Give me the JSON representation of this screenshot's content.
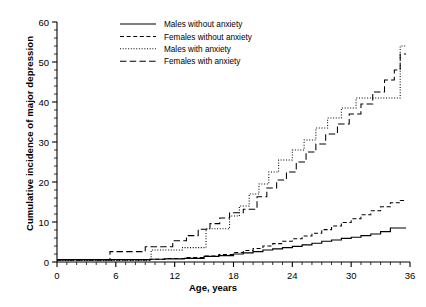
{
  "chart_data": {
    "type": "line",
    "title": "",
    "xlabel": "Age, years",
    "ylabel": "Cumulative incidence of major depression",
    "xlim": [
      0,
      36
    ],
    "ylim": [
      0,
      60
    ],
    "xticks": [
      0,
      6,
      12,
      18,
      24,
      30,
      36
    ],
    "yticks": [
      0,
      10,
      20,
      30,
      40,
      50,
      60
    ],
    "xtick_labels": [
      "0",
      "6",
      "12",
      "18",
      "24",
      "30",
      "36"
    ],
    "ytick_labels": [
      "0",
      "10",
      "20",
      "30",
      "40",
      "50",
      "60"
    ],
    "minor_ticks": true,
    "grid": false,
    "legend_position": "top-center",
    "step_style": "post",
    "series": [
      {
        "name": "Males without anxiety",
        "dash": "solid",
        "color": "#000000",
        "points": [
          [
            0,
            0.6
          ],
          [
            5.0,
            0.6
          ],
          [
            9.5,
            0.7
          ],
          [
            11.0,
            0.8
          ],
          [
            13.0,
            0.9
          ],
          [
            15.0,
            1.4
          ],
          [
            16.5,
            1.6
          ],
          [
            18.0,
            2.0
          ],
          [
            19.0,
            2.3
          ],
          [
            20.0,
            2.6
          ],
          [
            21.0,
            3.0
          ],
          [
            22.0,
            3.3
          ],
          [
            23.0,
            3.6
          ],
          [
            24.0,
            3.9
          ],
          [
            25.0,
            4.3
          ],
          [
            26.0,
            4.7
          ],
          [
            27.0,
            5.2
          ],
          [
            28.0,
            5.5
          ],
          [
            29.0,
            5.9
          ],
          [
            30.0,
            6.2
          ],
          [
            31.0,
            6.6
          ],
          [
            32.0,
            7.0
          ],
          [
            33.0,
            7.6
          ],
          [
            34.0,
            8.5
          ],
          [
            35.6,
            8.5
          ]
        ]
      },
      {
        "name": "Females without anxiety",
        "dash": "dash-short",
        "color": "#000000",
        "points": [
          [
            0,
            0.5
          ],
          [
            5.0,
            0.5
          ],
          [
            9.5,
            0.7
          ],
          [
            11.0,
            0.9
          ],
          [
            13.0,
            1.1
          ],
          [
            15.0,
            1.5
          ],
          [
            16.5,
            1.9
          ],
          [
            18.0,
            2.4
          ],
          [
            19.0,
            2.9
          ],
          [
            20.0,
            3.4
          ],
          [
            21.0,
            4.0
          ],
          [
            22.0,
            4.6
          ],
          [
            23.0,
            5.2
          ],
          [
            24.0,
            5.8
          ],
          [
            25.0,
            6.5
          ],
          [
            26.0,
            7.2
          ],
          [
            27.0,
            8.1
          ],
          [
            28.0,
            9.0
          ],
          [
            29.0,
            9.9
          ],
          [
            30.0,
            10.8
          ],
          [
            31.0,
            11.8
          ],
          [
            32.0,
            12.8
          ],
          [
            33.0,
            13.8
          ],
          [
            34.0,
            14.8
          ],
          [
            35.0,
            15.4
          ],
          [
            35.6,
            15.5
          ]
        ]
      },
      {
        "name": "Males with anxiety",
        "dash": "dotted",
        "color": "#000000",
        "points": [
          [
            0,
            0.4
          ],
          [
            9.6,
            0.4
          ],
          [
            9.6,
            3.0
          ],
          [
            12.8,
            3.0
          ],
          [
            12.8,
            3.6
          ],
          [
            15.2,
            3.6
          ],
          [
            15.2,
            8.3
          ],
          [
            17.6,
            8.3
          ],
          [
            17.6,
            11.5
          ],
          [
            18.6,
            11.5
          ],
          [
            18.6,
            14.0
          ],
          [
            19.6,
            14.0
          ],
          [
            19.6,
            17.0
          ],
          [
            20.6,
            17.0
          ],
          [
            20.6,
            19.5
          ],
          [
            21.6,
            19.5
          ],
          [
            21.6,
            22.5
          ],
          [
            22.6,
            22.5
          ],
          [
            22.6,
            25.5
          ],
          [
            24.0,
            25.5
          ],
          [
            24.0,
            28.0
          ],
          [
            25.2,
            28.0
          ],
          [
            25.2,
            30.5
          ],
          [
            26.4,
            30.5
          ],
          [
            26.4,
            33.5
          ],
          [
            27.6,
            33.5
          ],
          [
            27.6,
            36.0
          ],
          [
            29.0,
            36.0
          ],
          [
            29.0,
            38.5
          ],
          [
            30.5,
            38.5
          ],
          [
            30.5,
            41.0
          ],
          [
            35.0,
            41.0
          ],
          [
            35.0,
            54.0
          ],
          [
            35.6,
            54.0
          ]
        ]
      },
      {
        "name": "Females with anxiety",
        "dash": "dash-long",
        "color": "#000000",
        "points": [
          [
            0,
            0.5
          ],
          [
            5.4,
            0.5
          ],
          [
            5.4,
            2.6
          ],
          [
            9.0,
            2.6
          ],
          [
            9.0,
            3.8
          ],
          [
            11.8,
            3.8
          ],
          [
            11.8,
            5.3
          ],
          [
            13.2,
            5.3
          ],
          [
            13.2,
            6.6
          ],
          [
            14.4,
            6.6
          ],
          [
            14.4,
            8.2
          ],
          [
            15.6,
            8.2
          ],
          [
            15.6,
            9.6
          ],
          [
            16.6,
            9.6
          ],
          [
            16.6,
            11.0
          ],
          [
            17.6,
            11.0
          ],
          [
            17.6,
            12.3
          ],
          [
            19.0,
            12.3
          ],
          [
            19.0,
            13.2
          ],
          [
            20.4,
            13.2
          ],
          [
            20.4,
            16.3
          ],
          [
            21.4,
            16.3
          ],
          [
            21.4,
            18.5
          ],
          [
            22.4,
            18.5
          ],
          [
            22.4,
            20.5
          ],
          [
            23.4,
            20.5
          ],
          [
            23.4,
            22.5
          ],
          [
            24.4,
            22.5
          ],
          [
            24.4,
            25.0
          ],
          [
            25.4,
            25.0
          ],
          [
            25.4,
            27.5
          ],
          [
            26.4,
            27.5
          ],
          [
            26.4,
            29.5
          ],
          [
            27.4,
            29.5
          ],
          [
            27.4,
            32.0
          ],
          [
            28.6,
            32.0
          ],
          [
            28.6,
            34.5
          ],
          [
            29.8,
            34.5
          ],
          [
            29.8,
            37.0
          ],
          [
            31.0,
            37.0
          ],
          [
            31.0,
            39.5
          ],
          [
            32.2,
            39.5
          ],
          [
            32.2,
            42.5
          ],
          [
            33.4,
            42.5
          ],
          [
            33.4,
            45.5
          ],
          [
            34.4,
            45.5
          ],
          [
            34.4,
            48.0
          ],
          [
            35.0,
            48.0
          ],
          [
            35.0,
            52.0
          ],
          [
            35.6,
            52.0
          ]
        ]
      }
    ]
  },
  "legend": {
    "items": [
      {
        "label": "Males without anxiety",
        "dash": "solid"
      },
      {
        "label": "Females without anxiety",
        "dash": "dash-short"
      },
      {
        "label": "Males with anxiety",
        "dash": "dotted"
      },
      {
        "label": "Females with anxiety",
        "dash": "dash-long"
      }
    ]
  },
  "axes": {
    "x_label": "Age, years",
    "y_label": "Cumulative incidence of major depression"
  }
}
